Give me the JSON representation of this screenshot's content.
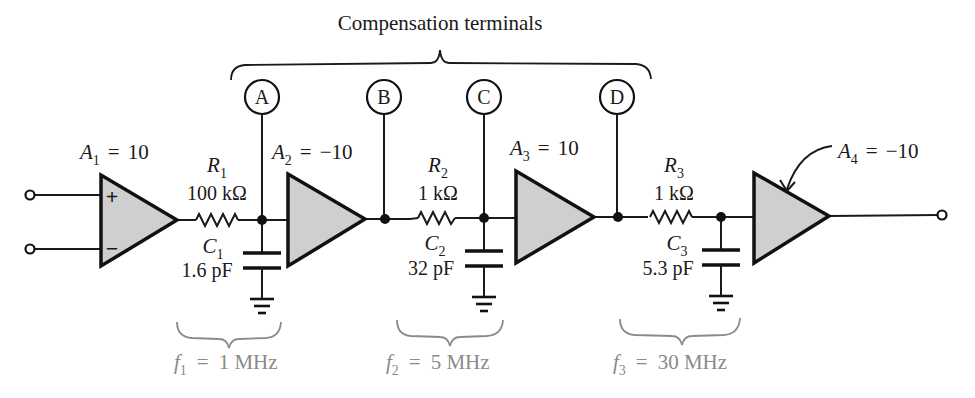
{
  "title": "Compensation terminals",
  "terminals": [
    {
      "label": "A"
    },
    {
      "label": "B"
    },
    {
      "label": "C"
    },
    {
      "label": "D"
    }
  ],
  "amplifiers": [
    {
      "name": "A",
      "sub": "1",
      "gain": "10",
      "eq": "="
    },
    {
      "name": "A",
      "sub": "2",
      "gain": "−10",
      "eq": "="
    },
    {
      "name": "A",
      "sub": "3",
      "gain": "10",
      "eq": "="
    },
    {
      "name": "A",
      "sub": "4",
      "gain": "−10",
      "eq": "="
    }
  ],
  "amp1_inputs": {
    "plus": "+",
    "minus": "−"
  },
  "resistors": [
    {
      "name": "R",
      "sub": "1",
      "value": "100 kΩ"
    },
    {
      "name": "R",
      "sub": "2",
      "value": "1 kΩ"
    },
    {
      "name": "R",
      "sub": "3",
      "value": "1 kΩ"
    }
  ],
  "capacitors": [
    {
      "name": "C",
      "sub": "1",
      "value": "1.6 pF"
    },
    {
      "name": "C",
      "sub": "2",
      "value": "32 pF"
    },
    {
      "name": "C",
      "sub": "3",
      "value": "5.3 pF"
    }
  ],
  "poles": [
    {
      "name": "f",
      "sub": "1",
      "eq": "=",
      "value": "1 MHz"
    },
    {
      "name": "f",
      "sub": "2",
      "eq": "=",
      "value": "5 MHz"
    },
    {
      "name": "f",
      "sub": "3",
      "eq": "=",
      "value": "30 MHz"
    }
  ],
  "colors": {
    "ink": "#1a1a1a",
    "amp_fill": "#cfcfcf",
    "pole_label": "#8a8a8a"
  }
}
